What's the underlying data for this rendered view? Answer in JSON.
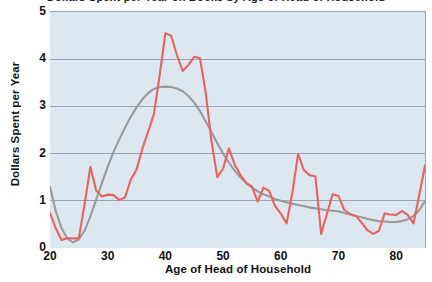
{
  "chart_data": {
    "type": "line",
    "title": "",
    "title_fragment": "Dollars Spent per Year on Books by Age of Head of Household",
    "xlabel": "Age of Head of Household",
    "ylabel": "Dollars Spent per Year",
    "xlim": [
      20,
      85
    ],
    "ylim": [
      0,
      5
    ],
    "xticks": [
      20,
      30,
      40,
      50,
      60,
      70,
      80
    ],
    "xtick_labels": [
      "20",
      "30",
      "40",
      "50",
      "60",
      "70",
      "80"
    ],
    "yticks": [
      0,
      1,
      2,
      3,
      4,
      5
    ],
    "ytick_labels": [
      "0",
      "1",
      "2",
      "3",
      "4",
      "5"
    ],
    "grid": "horizontal",
    "legend": "none",
    "plot_background": "#dce7ef",
    "gridline_color": "#93a6b6",
    "series": [
      {
        "name": "observed",
        "color": "#e8635f",
        "kind": "raw-data-line",
        "x": [
          20,
          21,
          22,
          23,
          24,
          25,
          26,
          27,
          28,
          29,
          30,
          31,
          32,
          33,
          34,
          35,
          36,
          37,
          38,
          39,
          40,
          41,
          42,
          43,
          44,
          45,
          46,
          47,
          48,
          49,
          50,
          51,
          52,
          53,
          54,
          55,
          56,
          57,
          58,
          59,
          60,
          61,
          62,
          63,
          64,
          65,
          66,
          67,
          68,
          69,
          70,
          71,
          72,
          73,
          74,
          75,
          76,
          77,
          78,
          79,
          80,
          81,
          82,
          83,
          84,
          85
        ],
        "y": [
          0.74,
          0.42,
          0.17,
          0.21,
          0.2,
          0.21,
          0.93,
          1.72,
          1.22,
          1.09,
          1.13,
          1.12,
          1.02,
          1.07,
          1.45,
          1.66,
          2.1,
          2.46,
          2.83,
          3.65,
          4.55,
          4.5,
          4.09,
          3.75,
          3.88,
          4.05,
          4.02,
          3.28,
          2.26,
          1.5,
          1.68,
          2.11,
          1.77,
          1.55,
          1.38,
          1.3,
          0.98,
          1.28,
          1.21,
          0.89,
          0.73,
          0.52,
          1.16,
          1.99,
          1.65,
          1.54,
          1.52,
          0.3,
          0.72,
          1.14,
          1.1,
          0.81,
          0.72,
          0.68,
          0.54,
          0.38,
          0.3,
          0.36,
          0.73,
          0.71,
          0.7,
          0.78,
          0.7,
          0.52,
          1.12,
          1.75
        ]
      },
      {
        "name": "smoothed trend",
        "color": "#9a9a9a",
        "kind": "fitted-curve",
        "x": [
          20,
          21,
          22,
          23,
          24,
          25,
          26,
          27,
          28,
          29,
          30,
          31,
          32,
          33,
          34,
          35,
          36,
          37,
          38,
          39,
          40,
          41,
          42,
          43,
          44,
          45,
          46,
          47,
          48,
          49,
          50,
          51,
          52,
          53,
          54,
          55,
          56,
          57,
          58,
          59,
          60,
          61,
          62,
          63,
          64,
          65,
          66,
          67,
          68,
          69,
          70,
          71,
          72,
          73,
          74,
          75,
          76,
          77,
          78,
          79,
          80,
          81,
          82,
          83,
          84,
          85
        ],
        "y": [
          1.3,
          0.78,
          0.42,
          0.2,
          0.12,
          0.18,
          0.37,
          0.67,
          1.02,
          1.38,
          1.72,
          2.03,
          2.3,
          2.55,
          2.78,
          2.98,
          3.15,
          3.28,
          3.37,
          3.41,
          3.42,
          3.41,
          3.38,
          3.32,
          3.22,
          3.08,
          2.9,
          2.68,
          2.45,
          2.22,
          2.0,
          1.81,
          1.64,
          1.5,
          1.38,
          1.28,
          1.2,
          1.14,
          1.09,
          1.04,
          1.0,
          0.97,
          0.94,
          0.91,
          0.89,
          0.86,
          0.84,
          0.82,
          0.8,
          0.79,
          0.78,
          0.74,
          0.71,
          0.68,
          0.65,
          0.62,
          0.59,
          0.57,
          0.56,
          0.55,
          0.55,
          0.57,
          0.61,
          0.68,
          0.8,
          1.0
        ]
      }
    ]
  },
  "axes": {
    "y_title": "Dollars Spent per Year",
    "x_title": "Age of Head of Household"
  }
}
